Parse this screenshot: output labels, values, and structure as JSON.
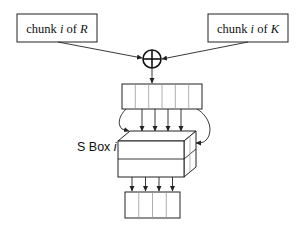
{
  "diagram": {
    "inputs": [
      {
        "prefix": "chunk ",
        "var": "i",
        "mid": " of ",
        "src": "R"
      },
      {
        "prefix": "chunk ",
        "var": "i",
        "mid": " of ",
        "src": "K"
      }
    ],
    "operator": "xor",
    "sbox_label": {
      "text": "S Box ",
      "var": "i"
    },
    "input_register_cells": 6,
    "output_register_cells": 4,
    "colors": {
      "stroke": "#222222",
      "background": "#ffffff",
      "inner_divider": "#999999"
    }
  }
}
